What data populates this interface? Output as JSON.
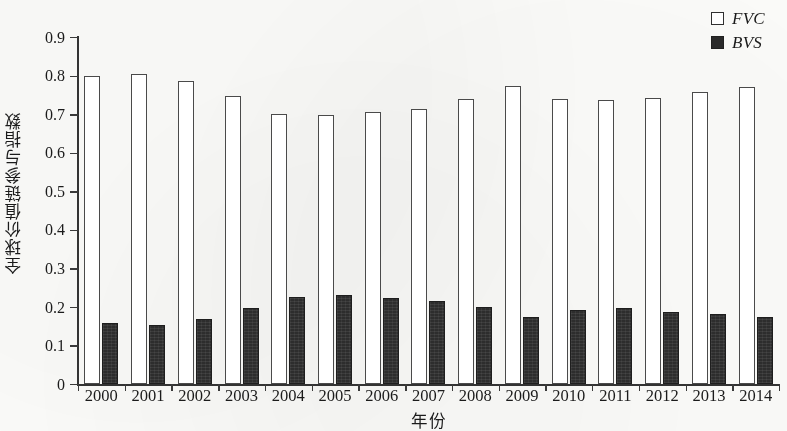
{
  "chart_data": {
    "type": "bar",
    "title": "",
    "xlabel": "年份",
    "ylabel": "全球价值链参与指数",
    "categories": [
      "2000",
      "2001",
      "2002",
      "2003",
      "2004",
      "2005",
      "2006",
      "2007",
      "2008",
      "2009",
      "2010",
      "2011",
      "2012",
      "2013",
      "2014"
    ],
    "series": [
      {
        "name": "FVC",
        "style": "open",
        "color": "#ffffff",
        "edge_color": "#4a4a4a",
        "values": [
          0.799,
          0.805,
          0.785,
          0.748,
          0.701,
          0.699,
          0.706,
          0.714,
          0.738,
          0.774,
          0.738,
          0.736,
          0.743,
          0.757,
          0.77
        ]
      },
      {
        "name": "BVS",
        "style": "filled",
        "color": "#2d2d2d",
        "edge_color": "#1e1e1e",
        "values": [
          0.159,
          0.153,
          0.169,
          0.196,
          0.226,
          0.23,
          0.222,
          0.216,
          0.2,
          0.175,
          0.191,
          0.196,
          0.186,
          0.181,
          0.175
        ]
      }
    ],
    "ylim": [
      0,
      0.9
    ],
    "ytick_values": [
      0,
      0.1,
      0.2,
      0.3,
      0.4,
      0.5,
      0.6,
      0.7,
      0.8,
      0.9
    ],
    "ytick_labels": [
      "0",
      "0.1",
      "0.2",
      "0.3",
      "0.4",
      "0.5",
      "0.6",
      "0.7",
      "0.8",
      "0.9"
    ],
    "grid": false,
    "legend_position": "top-right",
    "legend_entries": [
      "FVC",
      "BVS"
    ]
  },
  "legend": {
    "items": [
      {
        "label": "FVC",
        "swatch": "open-square"
      },
      {
        "label": "BVS",
        "swatch": "filled-square"
      }
    ]
  },
  "axes": {
    "y_title": "全球价值链参与指数",
    "x_title": "年份"
  }
}
